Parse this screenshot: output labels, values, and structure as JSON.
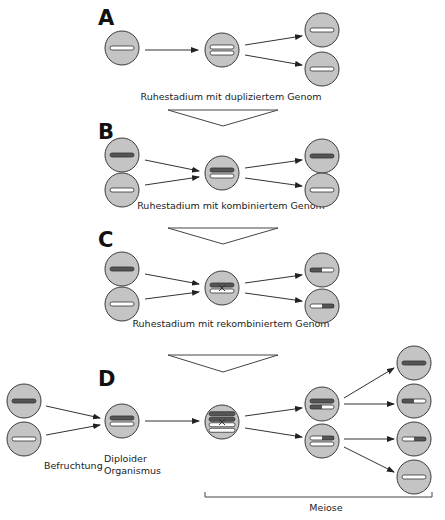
{
  "colors": {
    "cell_fill": "#c4c4c4",
    "cell_stroke": "#3a3a3a",
    "chromosome_dark": "#555555",
    "chromosome_light": "#ffffff",
    "chromosome_stroke": "#333333"
  },
  "panels": [
    {
      "id": "A",
      "label": "A",
      "caption": "Ruhestadium mit dupliziertem Genom",
      "description": "Haploid cell with one chromosome duplicates its genome and divides into two identical cells"
    },
    {
      "id": "B",
      "label": "B",
      "caption": "Ruhestadium mit kombiniertem Genom",
      "description": "Two cells (dark and light chromosome) fuse to a combined genome and separate again"
    },
    {
      "id": "C",
      "label": "C",
      "caption": "Ruhestadium mit rekombiniertem Genom",
      "description": "Two cells fuse, chromosomes cross over, producing recombined dark/light chromosomes"
    },
    {
      "id": "D",
      "label": "D",
      "captions": {
        "fertilization": "Befruchtung",
        "diploid_line1": "Diploider",
        "diploid_line2": "Organismus",
        "meiosis": "Meiose"
      },
      "description": "Fertilization forms a diploid organism; meiosis with duplication and recombination yields four haploid cells"
    }
  ],
  "chromosome_types": {
    "dark": "dark chromosome",
    "light": "light chromosome",
    "dark-light": "recombinant (dark left, light right)",
    "light-dark": "recombinant (light left, dark right)"
  }
}
